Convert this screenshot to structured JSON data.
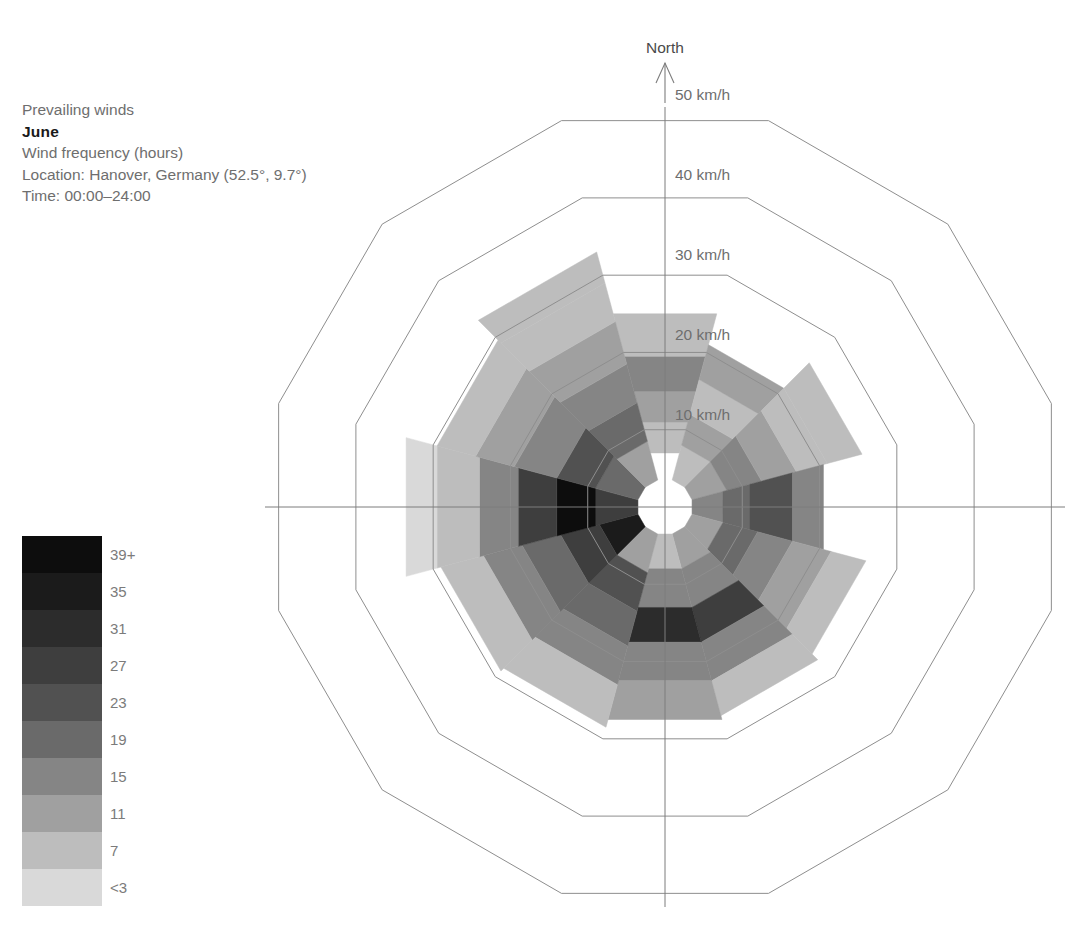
{
  "caption": {
    "title": "Prevailing winds",
    "month": "June",
    "metric": "Wind frequency (hours)",
    "location": "Location: Hanover, Germany (52.5°, 9.7°)",
    "time": "Time: 00:00–24:00"
  },
  "legend": {
    "labels": [
      "39+",
      "35",
      "31",
      "27",
      "23",
      "19",
      "15",
      "11",
      "7",
      "<3"
    ],
    "colors": [
      "#0d0d0d",
      "#1b1b1b",
      "#2c2c2c",
      "#3e3e3e",
      "#515151",
      "#6a6a6a",
      "#858585",
      "#a0a0a0",
      "#bdbdbd",
      "#d9d9d9"
    ]
  },
  "axes": {
    "north_label": "North",
    "radial_ticks": [
      "10 km/h",
      "20 km/h",
      "30 km/h",
      "40 km/h",
      "50 km/h"
    ],
    "radial_values": [
      10,
      20,
      30,
      40,
      50
    ],
    "rmax": 50,
    "center_hole_kmh": 3.5
  },
  "chart_data": {
    "type": "windrose",
    "subtitle": "Wind frequency (hours)",
    "location": "Hanover, Germany (52.5°, 9.7°)",
    "time_range": "00:00–24:00",
    "rlabel": "Wind speed (km/h)",
    "rlim": [
      0,
      50
    ],
    "grid": true,
    "n_sectors": 12,
    "sector_width_deg": 30,
    "legend_title": "Wind frequency (hours)",
    "bins": [
      {
        "label": "<3",
        "color": "#d9d9d9",
        "value": 1
      },
      {
        "label": "7",
        "color": "#bdbdbd",
        "value": 7
      },
      {
        "label": "11",
        "color": "#a0a0a0",
        "value": 11
      },
      {
        "label": "15",
        "color": "#858585",
        "value": 15
      },
      {
        "label": "19",
        "color": "#6a6a6a",
        "value": 19
      },
      {
        "label": "23",
        "color": "#515151",
        "value": 23
      },
      {
        "label": "27",
        "color": "#3e3e3e",
        "value": 27
      },
      {
        "label": "31",
        "color": "#2c2c2c",
        "value": 31
      },
      {
        "label": "35",
        "color": "#1b1b1b",
        "value": 35
      },
      {
        "label": "39+",
        "color": "#0d0d0d",
        "value": 39
      }
    ],
    "directions": [
      "N",
      "NNE",
      "ENE",
      "E",
      "ESE",
      "SSE",
      "S",
      "SSW",
      "WSW",
      "W",
      "WNW",
      "NNW"
    ],
    "direction_angles_deg": [
      0,
      30,
      60,
      90,
      120,
      150,
      180,
      210,
      240,
      270,
      300,
      330
    ],
    "sectors": [
      {
        "dir": "N",
        "angle": 0,
        "bands": [
          {
            "r0": 3.5,
            "r1": 7.0,
            "hours": 5,
            "color": "#ffffff"
          },
          {
            "r0": 7.0,
            "r1": 11.0,
            "hours": 9,
            "color": "#bdbdbd"
          },
          {
            "r0": 11.0,
            "r1": 15.0,
            "hours": 13,
            "color": "#a0a0a0"
          },
          {
            "r0": 15.0,
            "r1": 19.5,
            "hours": 17,
            "color": "#858585"
          },
          {
            "r0": 19.5,
            "r1": 25.0,
            "hours": 9,
            "color": "#bdbdbd"
          }
        ]
      },
      {
        "dir": "NNE",
        "angle": 30,
        "bands": [
          {
            "r0": 3.5,
            "r1": 8.0,
            "hours": 9,
            "color": "#bdbdbd"
          },
          {
            "r0": 8.0,
            "r1": 12.0,
            "hours": 13,
            "color": "#a0a0a0"
          },
          {
            "r0": 12.0,
            "r1": 16.5,
            "hours": 9,
            "color": "#bdbdbd"
          },
          {
            "r0": 16.5,
            "r1": 21.0,
            "hours": 13,
            "color": "#a0a0a0"
          }
        ]
      },
      {
        "dir": "ENE",
        "angle": 60,
        "bands": [
          {
            "r0": 3.5,
            "r1": 8.0,
            "hours": 13,
            "color": "#a0a0a0"
          },
          {
            "r0": 8.0,
            "r1": 12.5,
            "hours": 17,
            "color": "#858585"
          },
          {
            "r0": 12.5,
            "r1": 17.0,
            "hours": 13,
            "color": "#a0a0a0"
          },
          {
            "r0": 17.0,
            "r1": 21.0,
            "hours": 9,
            "color": "#bdbdbd"
          },
          {
            "r0": 21.0,
            "r1": 25.5,
            "hours": 9,
            "color": "#bdbdbd"
          }
        ]
      },
      {
        "dir": "E",
        "angle": 90,
        "bands": [
          {
            "r0": 3.5,
            "r1": 7.5,
            "hours": 17,
            "color": "#858585"
          },
          {
            "r0": 7.5,
            "r1": 11.0,
            "hours": 21,
            "color": "#6a6a6a"
          },
          {
            "r0": 11.0,
            "r1": 16.5,
            "hours": 25,
            "color": "#515151"
          },
          {
            "r0": 16.5,
            "r1": 20.5,
            "hours": 17,
            "color": "#858585"
          }
        ]
      },
      {
        "dir": "ESE",
        "angle": 120,
        "bands": [
          {
            "r0": 3.5,
            "r1": 7.5,
            "hours": 13,
            "color": "#a0a0a0"
          },
          {
            "r0": 7.5,
            "r1": 12.0,
            "hours": 21,
            "color": "#6a6a6a"
          },
          {
            "r0": 12.0,
            "r1": 16.5,
            "hours": 17,
            "color": "#858585"
          },
          {
            "r0": 16.5,
            "r1": 21.5,
            "hours": 13,
            "color": "#a0a0a0"
          },
          {
            "r0": 21.5,
            "r1": 26.0,
            "hours": 9,
            "color": "#bdbdbd"
          }
        ]
      },
      {
        "dir": "SSE",
        "angle": 150,
        "bands": [
          {
            "r0": 3.5,
            "r1": 8.0,
            "hours": 13,
            "color": "#a0a0a0"
          },
          {
            "r0": 8.0,
            "r1": 13.0,
            "hours": 17,
            "color": "#858585"
          },
          {
            "r0": 13.0,
            "r1": 17.5,
            "hours": 29,
            "color": "#3e3e3e"
          },
          {
            "r0": 17.5,
            "r1": 22.5,
            "hours": 17,
            "color": "#858585"
          },
          {
            "r0": 22.5,
            "r1": 27.0,
            "hours": 9,
            "color": "#bdbdbd"
          }
        ]
      },
      {
        "dir": "S",
        "angle": 180,
        "bands": [
          {
            "r0": 3.5,
            "r1": 8.0,
            "hours": 9,
            "color": "#bdbdbd"
          },
          {
            "r0": 8.0,
            "r1": 13.0,
            "hours": 17,
            "color": "#858585"
          },
          {
            "r0": 13.0,
            "r1": 17.5,
            "hours": 33,
            "color": "#2c2c2c"
          },
          {
            "r0": 17.5,
            "r1": 22.5,
            "hours": 17,
            "color": "#858585"
          },
          {
            "r0": 22.5,
            "r1": 27.5,
            "hours": 13,
            "color": "#a0a0a0"
          }
        ]
      },
      {
        "dir": "SSW",
        "angle": 210,
        "bands": [
          {
            "r0": 3.5,
            "r1": 8.5,
            "hours": 13,
            "color": "#a0a0a0"
          },
          {
            "r0": 8.5,
            "r1": 13.5,
            "hours": 25,
            "color": "#515151"
          },
          {
            "r0": 13.5,
            "r1": 18.0,
            "hours": 21,
            "color": "#6a6a6a"
          },
          {
            "r0": 18.0,
            "r1": 23.0,
            "hours": 17,
            "color": "#858585"
          },
          {
            "r0": 23.0,
            "r1": 28.5,
            "hours": 9,
            "color": "#bdbdbd"
          }
        ]
      },
      {
        "dir": "WSW",
        "angle": 240,
        "bands": [
          {
            "r0": 3.5,
            "r1": 8.5,
            "hours": 35,
            "color": "#1b1b1b"
          },
          {
            "r0": 8.5,
            "r1": 13.5,
            "hours": 29,
            "color": "#3e3e3e"
          },
          {
            "r0": 13.5,
            "r1": 18.5,
            "hours": 21,
            "color": "#6a6a6a"
          },
          {
            "r0": 18.5,
            "r1": 23.5,
            "hours": 17,
            "color": "#858585"
          },
          {
            "r0": 23.5,
            "r1": 29.0,
            "hours": 9,
            "color": "#bdbdbd"
          }
        ]
      },
      {
        "dir": "W",
        "angle": 270,
        "bands": [
          {
            "r0": 3.5,
            "r1": 9.0,
            "hours": 29,
            "color": "#3e3e3e"
          },
          {
            "r0": 9.0,
            "r1": 14.0,
            "hours": 39,
            "color": "#0d0d0d"
          },
          {
            "r0": 14.0,
            "r1": 19.0,
            "hours": 29,
            "color": "#3e3e3e"
          },
          {
            "r0": 19.0,
            "r1": 24.0,
            "hours": 17,
            "color": "#858585"
          },
          {
            "r0": 24.0,
            "r1": 29.5,
            "hours": 9,
            "color": "#bdbdbd"
          },
          {
            "r0": 29.5,
            "r1": 33.5,
            "hours": 5,
            "color": "#d9d9d9"
          }
        ]
      },
      {
        "dir": "WNW",
        "angle": 300,
        "bands": [
          {
            "r0": 3.5,
            "r1": 9.0,
            "hours": 21,
            "color": "#6a6a6a"
          },
          {
            "r0": 9.0,
            "r1": 14.0,
            "hours": 25,
            "color": "#515151"
          },
          {
            "r0": 14.0,
            "r1": 19.5,
            "hours": 17,
            "color": "#858585"
          },
          {
            "r0": 19.5,
            "r1": 24.5,
            "hours": 13,
            "color": "#a0a0a0"
          },
          {
            "r0": 24.5,
            "r1": 29.5,
            "hours": 9,
            "color": "#bdbdbd"
          }
        ]
      },
      {
        "dir": "NNW",
        "angle": 330,
        "bands": [
          {
            "r0": 3.5,
            "r1": 8.5,
            "hours": 13,
            "color": "#a0a0a0"
          },
          {
            "r0": 8.5,
            "r1": 13.5,
            "hours": 21,
            "color": "#6a6a6a"
          },
          {
            "r0": 13.5,
            "r1": 18.5,
            "hours": 17,
            "color": "#858585"
          },
          {
            "r0": 18.5,
            "r1": 24.0,
            "hours": 13,
            "color": "#a0a0a0"
          },
          {
            "r0": 24.0,
            "r1": 29.0,
            "hours": 9,
            "color": "#bdbdbd"
          },
          {
            "r0": 29.0,
            "r1": 33.0,
            "hours": 9,
            "color": "#bdbdbd"
          }
        ]
      }
    ]
  },
  "geometry": {
    "cx": 665,
    "cy": 507,
    "px_per_kmh": 8.0,
    "polygon_sides": 12
  }
}
